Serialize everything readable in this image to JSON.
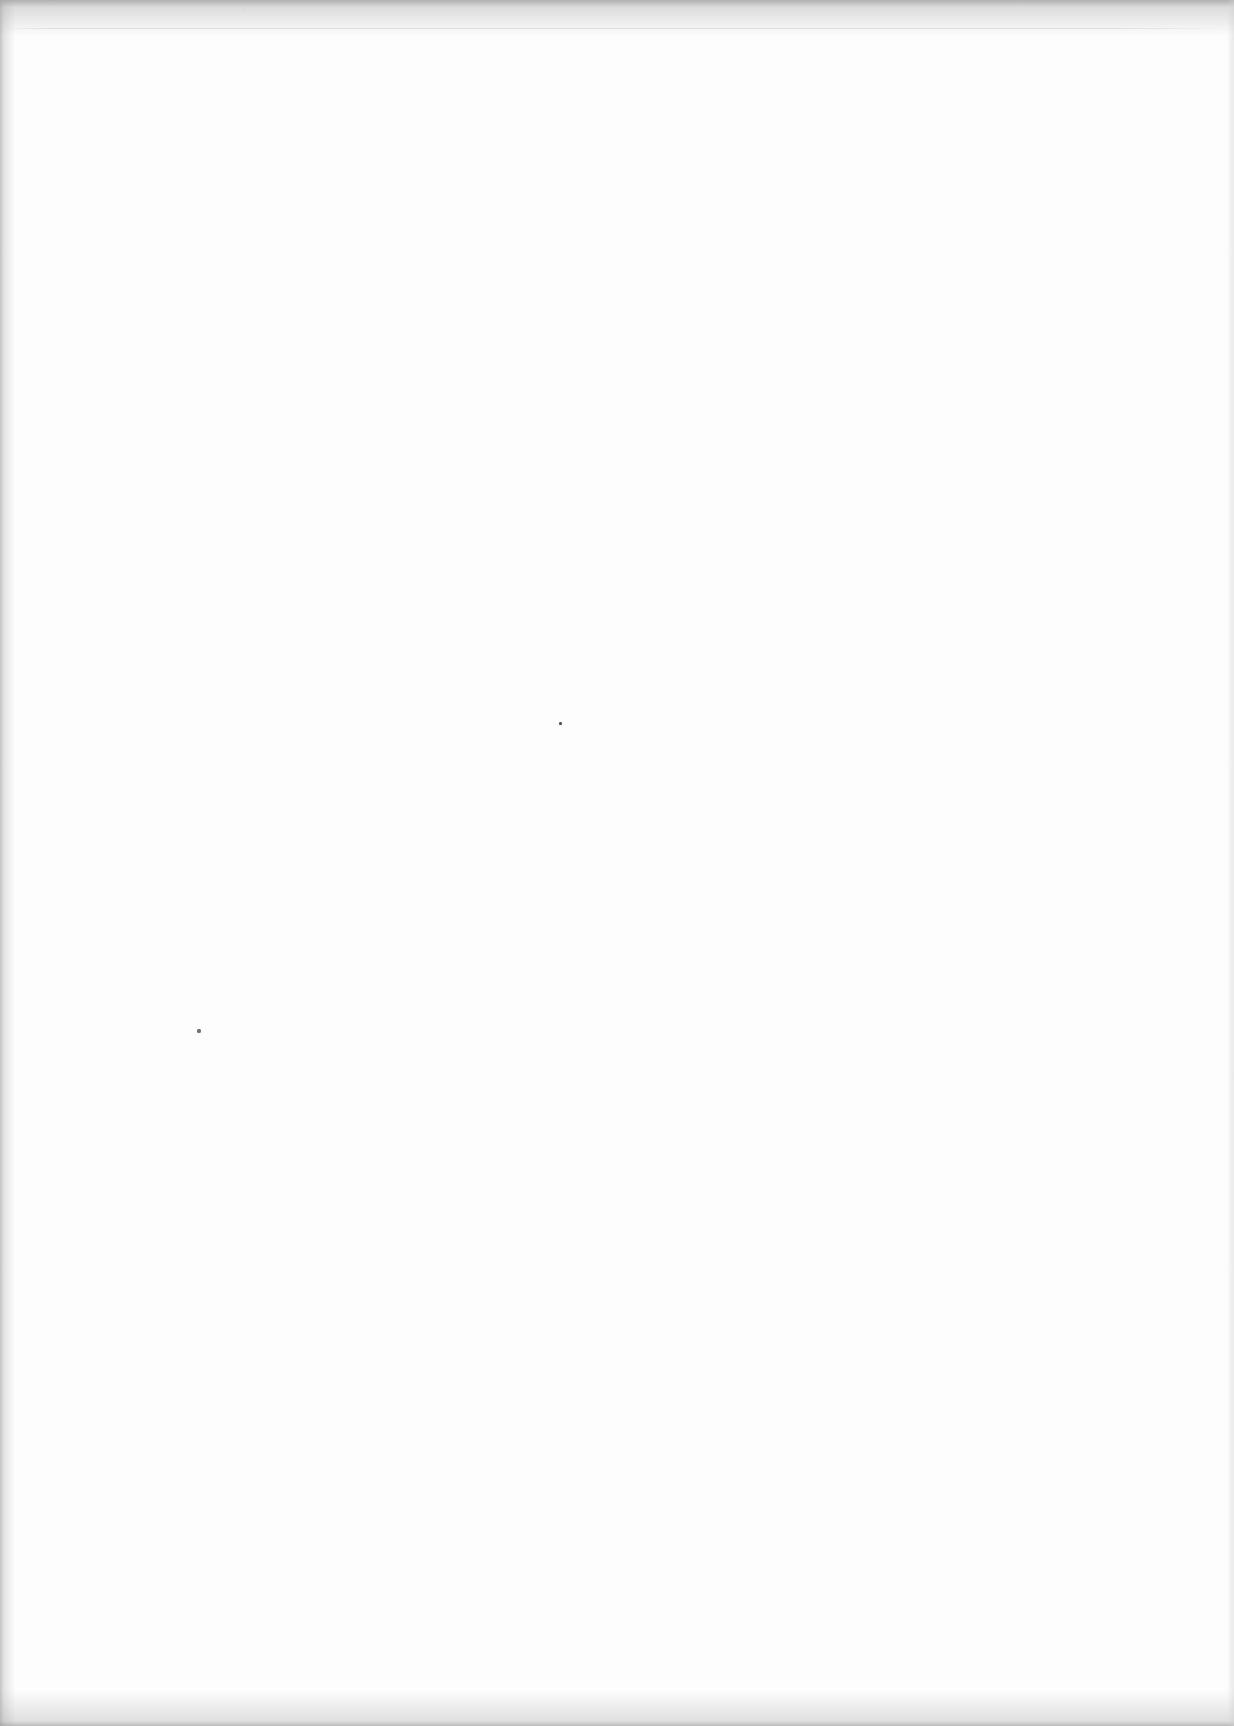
{
  "page": {
    "content_text": "",
    "colors": {
      "paper": "#fdfdfd",
      "top-shadow": "#8f8f8f",
      "left-shadow": "#a3a3a3",
      "bottom-shadow": "#9b9b9b",
      "right-shadow": "#cfcfcf",
      "hairline": "#d9d9d9",
      "noise": "#858585"
    },
    "hairline_y": 28,
    "ink_specks": [
      {
        "x": 560,
        "y": 723,
        "d": 3,
        "color": "#4d4d4d"
      },
      {
        "x": 199,
        "y": 1031,
        "d": 4,
        "color": "#6e6e6e"
      }
    ]
  }
}
